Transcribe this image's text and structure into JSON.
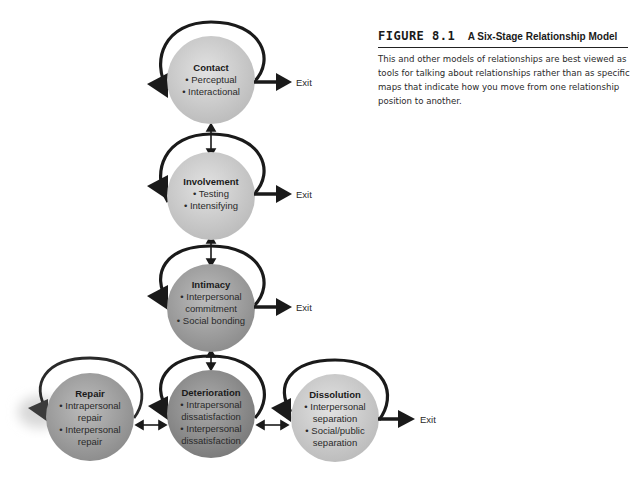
{
  "figure": {
    "label": "FIGURE 8.1",
    "title": "A Six-Stage Relationship Model",
    "caption": "This and other models of relationships are best viewed as tools for talking about relationships rather than as specific maps that indicate how you move from one relationship position to another."
  },
  "stages": {
    "contact": {
      "title": "Contact",
      "items": [
        "• Perceptual",
        "• Interactional"
      ],
      "exit": "Exit"
    },
    "involvement": {
      "title": "Involvement",
      "items": [
        "• Testing",
        "• Intensifying"
      ],
      "exit": "Exit"
    },
    "intimacy": {
      "title": "Intimacy",
      "lines": [
        "• Interpersonal",
        "commitment",
        "• Social bonding"
      ],
      "exit": "Exit"
    },
    "repair": {
      "title": "Repair",
      "lines": [
        "• Intrapersonal",
        "repair",
        "• Interpersonal",
        "repair"
      ]
    },
    "deterioration": {
      "title": "Deterioration",
      "lines": [
        "• Intrapersonal",
        "dissatisfaction",
        "• Interpersonal",
        "dissatisfaction"
      ]
    },
    "dissolution": {
      "title": "Dissolution",
      "lines": [
        "• Interpersonal",
        "separation",
        "• Social/public",
        "separation"
      ],
      "exit": "Exit"
    }
  },
  "colors": {
    "circle_light": "#d4d4d4",
    "circle_dark": "#9a9a9a",
    "arrow": "#1a1a1a"
  }
}
